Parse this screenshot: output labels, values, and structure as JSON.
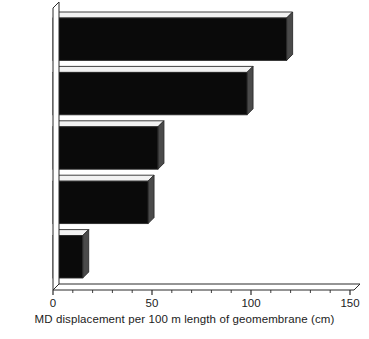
{
  "chart_data": {
    "type": "bar",
    "orientation": "horizontal",
    "style": "3d-bar",
    "title": "",
    "subtitle": "",
    "categories": [
      "HDPE",
      "LLDPE",
      "fPP",
      "PVC",
      "fPP-R"
    ],
    "values": [
      118,
      98,
      53,
      48,
      15
    ],
    "series": [
      {
        "name": "MD displacement",
        "values": [
          118,
          98,
          53,
          48,
          15
        ]
      }
    ],
    "xlabel": "MD displacement per 100 m length of geomembrane (cm)",
    "ylabel": "",
    "xlim": [
      0,
      150
    ],
    "xticks": [
      0,
      50,
      100,
      150
    ],
    "xtick_labels": [
      "0",
      "50",
      "100",
      "150"
    ],
    "minor_ticks_per_interval": 5,
    "grid": false,
    "legend": false,
    "legend_position": "none",
    "bar_fill_color": "#0a0a0a",
    "bar_side_color": "#4a4a4a",
    "bar_top_color": "#f2f2f2",
    "axis_color": "#2b2b2b",
    "background_color": "#ffffff",
    "annotations": []
  },
  "axis": {
    "title": "MD displacement per 100 m length of geomembrane (cm)",
    "ticks": [
      {
        "label": "0",
        "value": 0
      },
      {
        "label": "50",
        "value": 50
      },
      {
        "label": "100",
        "value": 100
      },
      {
        "label": "150",
        "value": 150
      }
    ]
  },
  "categories": [
    {
      "label": "HDPE",
      "value": 118
    },
    {
      "label": "LLDPE",
      "value": 98
    },
    {
      "label": "fPP",
      "value": 53
    },
    {
      "label": "PVC",
      "value": 48
    },
    {
      "label": "fPP-R",
      "value": 15
    }
  ]
}
